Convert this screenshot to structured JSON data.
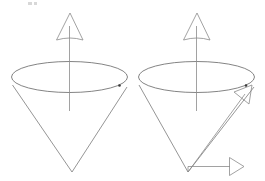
{
  "figure": {
    "background_color": "#ffffff",
    "line_color": "#8a8a8a",
    "outline_color": "#7a7a7a",
    "dot_color": "#3a3a3a",
    "width": 265,
    "height": 181,
    "caption": ""
  },
  "panels": [
    {
      "id": "left-cone",
      "label": "",
      "ellipse": {
        "cx": 69.5,
        "cy": 77.0,
        "rx": 58.0,
        "ry": 15.5
      },
      "apex": {
        "x": 72.0,
        "y": 172.0
      },
      "left_edge": {
        "x": 12.5,
        "y": 85.0
      },
      "right_edge": {
        "x": 127.0,
        "y": 87.0
      },
      "axis": {
        "x": 69.5,
        "y_bottom": 111.0,
        "y_top": 26.0,
        "arrow_tip": {
          "x": 70.0,
          "y": 13.0
        },
        "arrow_left": {
          "x": 56.5,
          "y": 40.0
        },
        "arrow_right": {
          "x": 83.0,
          "y": 40.0
        }
      },
      "rim_dot": {
        "cx": 119.5,
        "cy": 85.5,
        "r": 1.3
      },
      "vectors": []
    },
    {
      "id": "right-cone",
      "label": "",
      "ellipse": {
        "cx": 196.5,
        "cy": 77.0,
        "rx": 58.0,
        "ry": 15.5
      },
      "apex": {
        "x": 188.0,
        "y": 172.0
      },
      "left_edge": {
        "x": 139.0,
        "y": 85.0
      },
      "right_edge": {
        "x": 254.0,
        "y": 87.0
      },
      "axis": {
        "x": 196.5,
        "y_bottom": 111.0,
        "y_top": 26.0,
        "arrow_tip": {
          "x": 197.0,
          "y": 13.0
        },
        "arrow_left": {
          "x": 183.5,
          "y": 40.0
        },
        "arrow_right": {
          "x": 210.0,
          "y": 40.0
        }
      },
      "rim_dot": {
        "cx": 246.0,
        "cy": 85.5,
        "r": 1.3
      },
      "vectors": [
        {
          "id": "diagonal-vector",
          "label": "",
          "from": {
            "x": 188.0,
            "y": 172.0
          },
          "to": {
            "x": 245.0,
            "y": 94.0
          },
          "arrow_tip": {
            "x": 252.0,
            "y": 85.0
          },
          "arrow_back_a": {
            "x": 234.0,
            "y": 92.0
          },
          "arrow_back_b": {
            "x": 249.0,
            "y": 104.0
          }
        },
        {
          "id": "horizontal-vector",
          "label": "",
          "from": {
            "x": 188.0,
            "y": 166.5
          },
          "to": {
            "x": 230.0,
            "y": 166.5
          },
          "arrow_tip": {
            "x": 244.0,
            "y": 166.5
          },
          "arrow_back_a": {
            "x": 229.5,
            "y": 157.5
          },
          "arrow_back_b": {
            "x": 229.5,
            "y": 175.5
          }
        }
      ]
    }
  ],
  "artifacts": [
    {
      "id": "top-mark-1",
      "x": 28.0,
      "y": 2.0,
      "w": 4.0,
      "h": 3.0
    },
    {
      "id": "top-mark-2",
      "x": 34.0,
      "y": 2.0,
      "w": 3.0,
      "h": 3.0
    }
  ]
}
